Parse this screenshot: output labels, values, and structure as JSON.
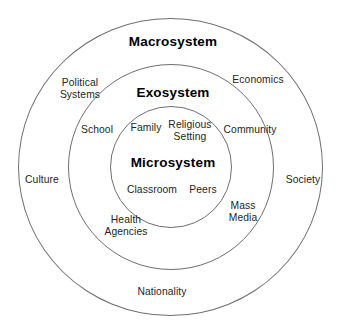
{
  "diagram": {
    "background_color": "#ffffff",
    "stroke_color": "#6f6f6f",
    "text_color": "#242424",
    "rings": [
      {
        "id": "macrosystem",
        "title": "Macrosystem",
        "level": 3,
        "title_position": {
          "x": 173,
          "y": 42
        },
        "labels": [
          {
            "name": "political-systems",
            "text": "Political\nSystems",
            "x": 80,
            "y": 89
          },
          {
            "name": "economics",
            "text": "Economics",
            "x": 258,
            "y": 80
          },
          {
            "name": "culture",
            "text": "Culture",
            "x": 42,
            "y": 180
          },
          {
            "name": "society",
            "text": "Society",
            "x": 303,
            "y": 180
          },
          {
            "name": "nationality",
            "text": "Nationality",
            "x": 162,
            "y": 292
          }
        ]
      },
      {
        "id": "exosystem",
        "title": "Exosystem",
        "level": 2,
        "title_position": {
          "x": 173,
          "y": 93
        },
        "labels": [
          {
            "name": "school",
            "text": "School",
            "x": 97,
            "y": 130
          },
          {
            "name": "community",
            "text": "Community",
            "x": 250,
            "y": 130
          },
          {
            "name": "health-agencies",
            "text": "Health\nAgencies",
            "x": 126,
            "y": 226
          },
          {
            "name": "mass-media",
            "text": "Mass\nMedia",
            "x": 243,
            "y": 212
          }
        ]
      },
      {
        "id": "microsystem",
        "title": "Microsystem",
        "level": 1,
        "title_position": {
          "x": 173,
          "y": 163
        },
        "labels": [
          {
            "name": "family",
            "text": "Family",
            "x": 146,
            "y": 128
          },
          {
            "name": "religious-setting",
            "text": "Religious\nSetting",
            "x": 190,
            "y": 131
          },
          {
            "name": "classroom",
            "text": "Classroom",
            "x": 152,
            "y": 190
          },
          {
            "name": "peers",
            "text": "Peers",
            "x": 203,
            "y": 190
          }
        ]
      }
    ]
  }
}
